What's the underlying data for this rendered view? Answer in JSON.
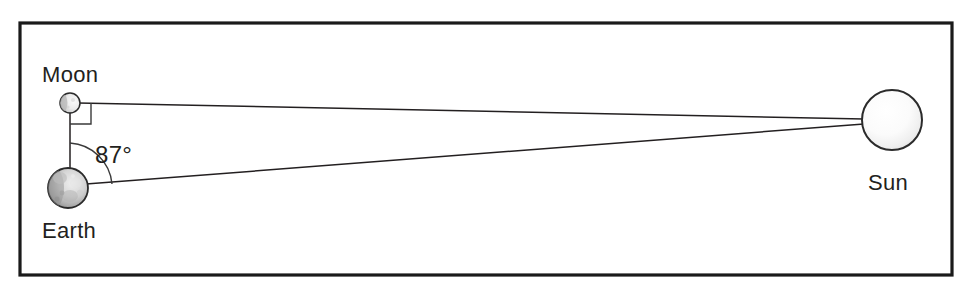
{
  "diagram": {
    "background_color": "#ffffff",
    "frame": {
      "name": "outer-border",
      "stroke_color": "#1a1a1a",
      "x": 20,
      "y": 23,
      "width": 932,
      "height": 252
    },
    "bodies": [
      {
        "key": "moon",
        "label": "Moon",
        "label_x": 42,
        "label_y": 82,
        "cx": 70,
        "cy": 103,
        "r": 10,
        "fill_light": "#f2f2f2",
        "fill_dark": "#9a9a9a"
      },
      {
        "key": "earth",
        "label": "Earth",
        "label_x": 42,
        "label_y": 238,
        "cx": 68,
        "cy": 188,
        "r": 20,
        "fill_light": "#e2e2e2",
        "fill_dark": "#6e6e6e"
      },
      {
        "key": "sun",
        "label": "Sun",
        "label_x": 868,
        "label_y": 190,
        "cx": 892,
        "cy": 120,
        "r": 30,
        "fill_light": "#ffffff",
        "fill_dark": "#dcdcdc"
      }
    ],
    "angle": {
      "value": "87°",
      "label_x": 95,
      "label_y": 163,
      "vertex": "earth",
      "arc_radius": 45
    },
    "right_angle_marker": {
      "vertex": "moon",
      "size": 21
    },
    "sight_lines": [
      {
        "name": "moon-to-sun-line",
        "from": "moon",
        "to": "sun"
      },
      {
        "name": "earth-to-sun-line",
        "from": "earth",
        "to": "sun"
      },
      {
        "name": "moon-to-earth-line",
        "from": "moon",
        "to": "earth"
      }
    ],
    "line_color": "#231f20"
  }
}
